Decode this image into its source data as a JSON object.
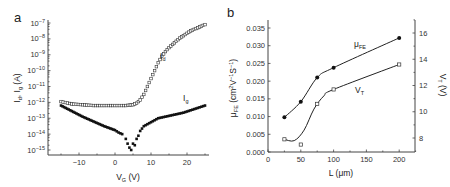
{
  "chart_data": [
    {
      "panel": "a",
      "type": "scatter",
      "title": "",
      "xlabel": "V_G (V)",
      "ylabel": "I_d, I_g (A)",
      "xlim": [
        -18,
        28
      ],
      "ylim_log10": [
        -15.2,
        -6.8
      ],
      "yscale": "log",
      "x_ticks": [
        -10,
        0,
        10,
        20
      ],
      "x_tick_labels": [
        "−10",
        "0",
        "10",
        "20"
      ],
      "y_ticks_log10": [
        -7,
        -8,
        -9,
        -10,
        -11,
        -12,
        -13,
        -14,
        -15
      ],
      "y_tick_labels": [
        "10−7",
        "10−8",
        "10−9",
        "10−10",
        "10−11",
        "10−12",
        "10−13",
        "10−14",
        "10−15"
      ],
      "series": [
        {
          "name": "I_d",
          "label_text": "I",
          "label_sub": "d",
          "marker": "open-square",
          "x": [
            -15,
            -12,
            -9,
            -6,
            -3,
            0,
            3,
            5,
            6,
            7,
            8,
            9,
            10,
            11,
            12,
            13,
            14,
            15,
            16,
            17,
            18,
            19,
            20,
            21,
            22,
            23,
            24,
            25
          ],
          "y_log10": [
            -11.95,
            -12.1,
            -12.15,
            -12.2,
            -12.2,
            -12.2,
            -12.2,
            -12.15,
            -12.05,
            -11.85,
            -11.5,
            -11.0,
            -10.5,
            -10.0,
            -9.5,
            -9.1,
            -8.8,
            -8.55,
            -8.35,
            -8.15,
            -7.95,
            -7.8,
            -7.65,
            -7.5,
            -7.4,
            -7.3,
            -7.2,
            -7.1
          ]
        },
        {
          "name": "I_g",
          "label_text": "I",
          "label_sub": "g",
          "marker": "filled-square",
          "x": [
            -15,
            -12,
            -9,
            -6,
            -3,
            0,
            1,
            2,
            3,
            3.5,
            4,
            4.5,
            5,
            5.5,
            6,
            6.5,
            7,
            8,
            10,
            12,
            13,
            15,
            17,
            19,
            21,
            23,
            25
          ],
          "y_log10": [
            -12.2,
            -12.55,
            -12.9,
            -13.2,
            -13.5,
            -13.75,
            -13.9,
            -14.0,
            -14.3,
            -14.6,
            -14.85,
            -15.0,
            -14.6,
            -14.7,
            -14.3,
            -14.1,
            -13.8,
            -13.5,
            -13.25,
            -13.0,
            -12.95,
            -12.85,
            -12.75,
            -12.65,
            -12.5,
            -12.35,
            -12.2
          ]
        }
      ]
    },
    {
      "panel": "b",
      "type": "line",
      "title": "",
      "xlabel": "L (μm)",
      "ylabel": "μFE (cm²V⁻¹S⁻¹)",
      "y2label": "V_T (V)",
      "xlim": [
        0,
        230
      ],
      "ylim": [
        0,
        0.038
      ],
      "y2lim": [
        7,
        17
      ],
      "x_ticks": [
        0,
        50,
        100,
        150,
        200
      ],
      "x_tick_labels": [
        "0",
        "50",
        "100",
        "150",
        "200"
      ],
      "y_ticks": [
        0,
        0.005,
        0.01,
        0.015,
        0.02,
        0.025,
        0.03,
        0.035
      ],
      "y_tick_labels": [
        "0.000",
        "0.005",
        "0.010",
        "0.015",
        "0.020",
        "0.025",
        "0.030",
        "0.035"
      ],
      "y2_ticks": [
        8,
        10,
        12,
        14,
        16
      ],
      "y2_tick_labels": [
        "8",
        "10",
        "12",
        "14",
        "16"
      ],
      "series": [
        {
          "name": "μFE",
          "label_text": "μ",
          "label_sub": "FE",
          "axis": "left",
          "marker": "filled-circle",
          "x": [
            25,
            50,
            75,
            100,
            200
          ],
          "y": [
            0.0098,
            0.0142,
            0.021,
            0.0238,
            0.0322
          ]
        },
        {
          "name": "V_T",
          "label_text": "V",
          "label_sub": "T",
          "axis": "right",
          "marker": "open-square",
          "x": [
            25,
            50,
            75,
            100,
            200
          ],
          "y": [
            7.9,
            7.5,
            10.6,
            11.7,
            13.6
          ]
        }
      ]
    }
  ],
  "panels": {
    "a": {
      "label": "a"
    },
    "b": {
      "label": "b"
    }
  }
}
